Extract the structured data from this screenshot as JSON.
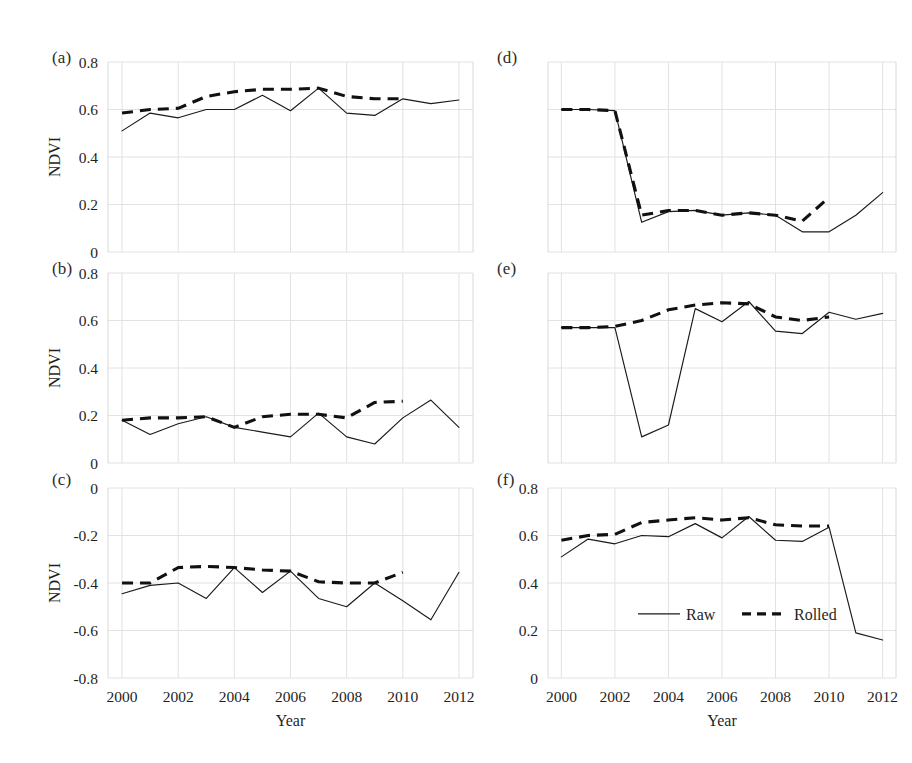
{
  "figure": {
    "background": "#ffffff",
    "grid_color": "#e2e2e2",
    "line_color": "#1a1a1a",
    "xlabel": "Year",
    "ylabel": "NDVI",
    "xticks": [
      "2000",
      "2002",
      "2004",
      "2006",
      "2008",
      "2010",
      "2012"
    ],
    "legend": {
      "raw_label": "Raw",
      "rolled_label": "Rolled"
    },
    "panel_labels": {
      "a": "(a)",
      "b": "(b)",
      "c": "(c)",
      "d": "(d)",
      "e": "(e)",
      "f": "(f)"
    }
  },
  "chart_data": [
    {
      "type": "line",
      "panel": "(a)",
      "title": "",
      "xlabel": "Year",
      "ylabel": "NDVI",
      "xlim": [
        1999.5,
        2012.5
      ],
      "ylim": [
        0,
        0.8
      ],
      "yticks": [
        0,
        0.2,
        0.4,
        0.6,
        0.8
      ],
      "ytick_labels": [
        "0",
        "0.2",
        "0.4",
        "0.6",
        "0.8"
      ],
      "xticks": [
        2000,
        2002,
        2004,
        2006,
        2008,
        2010,
        2012
      ],
      "grid": true,
      "legend": [
        "Raw",
        "Rolled"
      ],
      "x": [
        2000,
        2001,
        2002,
        2003,
        2004,
        2005,
        2006,
        2007,
        2008,
        2009,
        2010,
        2011,
        2012
      ],
      "series": [
        {
          "name": "Raw",
          "style": "solid",
          "values": [
            0.51,
            0.585,
            0.565,
            0.6,
            0.6,
            0.66,
            0.595,
            0.69,
            0.585,
            0.575,
            0.645,
            0.625,
            0.64
          ]
        },
        {
          "name": "Rolled",
          "style": "dashed",
          "values": [
            0.585,
            0.6,
            0.605,
            0.655,
            0.675,
            0.685,
            0.685,
            0.69,
            0.655,
            0.645,
            0.645,
            null,
            null
          ]
        }
      ]
    },
    {
      "type": "line",
      "panel": "(b)",
      "title": "",
      "xlabel": "Year",
      "ylabel": "NDVI",
      "xlim": [
        1999.5,
        2012.5
      ],
      "ylim": [
        0,
        0.8
      ],
      "yticks": [
        0,
        0.2,
        0.4,
        0.6,
        0.8
      ],
      "ytick_labels": [
        "0",
        "0.2",
        "0.4",
        "0.6",
        "0.8"
      ],
      "xticks": [
        2000,
        2002,
        2004,
        2006,
        2008,
        2010,
        2012
      ],
      "grid": true,
      "legend": [
        "Raw",
        "Rolled"
      ],
      "x": [
        2000,
        2001,
        2002,
        2003,
        2004,
        2005,
        2006,
        2007,
        2008,
        2009,
        2010,
        2011,
        2012
      ],
      "series": [
        {
          "name": "Raw",
          "style": "solid",
          "values": [
            0.18,
            0.12,
            0.165,
            0.195,
            0.15,
            0.13,
            0.11,
            0.21,
            0.11,
            0.08,
            0.19,
            0.265,
            0.15
          ]
        },
        {
          "name": "Rolled",
          "style": "dashed",
          "values": [
            0.18,
            0.19,
            0.19,
            0.195,
            0.15,
            0.195,
            0.205,
            0.205,
            0.19,
            0.255,
            0.26,
            null,
            null
          ]
        }
      ]
    },
    {
      "type": "line",
      "panel": "(c)",
      "title": "",
      "xlabel": "Year",
      "ylabel": "NDVI",
      "xlim": [
        1999.5,
        2012.5
      ],
      "ylim": [
        -0.8,
        0
      ],
      "yticks": [
        -0.8,
        -0.6,
        -0.4,
        -0.2,
        0
      ],
      "ytick_labels": [
        "-0.8",
        "-0.6",
        "-0.4",
        "-0.2",
        "0"
      ],
      "xticks": [
        2000,
        2002,
        2004,
        2006,
        2008,
        2010,
        2012
      ],
      "grid": true,
      "legend": [
        "Raw",
        "Rolled"
      ],
      "x": [
        2000,
        2001,
        2002,
        2003,
        2004,
        2005,
        2006,
        2007,
        2008,
        2009,
        2010,
        2011,
        2012
      ],
      "series": [
        {
          "name": "Raw",
          "style": "solid",
          "values": [
            -0.445,
            -0.41,
            -0.4,
            -0.465,
            -0.335,
            -0.44,
            -0.35,
            -0.465,
            -0.5,
            -0.4,
            -0.475,
            -0.555,
            -0.355
          ]
        },
        {
          "name": "Rolled",
          "style": "dashed",
          "values": [
            -0.4,
            -0.4,
            -0.335,
            -0.33,
            -0.335,
            -0.345,
            -0.35,
            -0.395,
            -0.4,
            -0.4,
            -0.355,
            null,
            null
          ]
        }
      ]
    },
    {
      "type": "line",
      "panel": "(d)",
      "title": "",
      "xlabel": "Year",
      "ylabel": "",
      "xlim": [
        1999.5,
        2012.5
      ],
      "ylim": [
        0,
        0.8
      ],
      "yticks": [
        0,
        0.2,
        0.4,
        0.6,
        0.8
      ],
      "ytick_labels": [],
      "xticks": [
        2000,
        2002,
        2004,
        2006,
        2008,
        2010,
        2012
      ],
      "grid": true,
      "legend": [
        "Raw",
        "Rolled"
      ],
      "x": [
        2000,
        2001,
        2002,
        2003,
        2004,
        2005,
        2006,
        2007,
        2008,
        2009,
        2010,
        2011,
        2012
      ],
      "series": [
        {
          "name": "Raw",
          "style": "solid",
          "values": [
            0.6,
            0.6,
            0.595,
            0.125,
            0.17,
            0.175,
            0.155,
            0.165,
            0.155,
            0.085,
            0.085,
            0.155,
            0.25
          ]
        },
        {
          "name": "Rolled",
          "style": "dashed",
          "values": [
            0.6,
            0.6,
            0.595,
            0.155,
            0.175,
            0.175,
            0.155,
            0.165,
            0.155,
            0.13,
            0.23,
            null,
            null
          ]
        }
      ]
    },
    {
      "type": "line",
      "panel": "(e)",
      "title": "",
      "xlabel": "Year",
      "ylabel": "",
      "xlim": [
        1999.5,
        2012.5
      ],
      "ylim": [
        0,
        0.8
      ],
      "yticks": [
        0,
        0.2,
        0.4,
        0.6,
        0.8
      ],
      "ytick_labels": [],
      "xticks": [
        2000,
        2002,
        2004,
        2006,
        2008,
        2010,
        2012
      ],
      "grid": true,
      "legend": [
        "Raw",
        "Rolled"
      ],
      "x": [
        2000,
        2001,
        2002,
        2003,
        2004,
        2005,
        2006,
        2007,
        2008,
        2009,
        2010,
        2011,
        2012
      ],
      "series": [
        {
          "name": "Raw",
          "style": "solid",
          "values": [
            0.57,
            0.57,
            0.57,
            0.11,
            0.16,
            0.65,
            0.595,
            0.68,
            0.555,
            0.545,
            0.635,
            0.605,
            0.63
          ]
        },
        {
          "name": "Rolled",
          "style": "dashed",
          "values": [
            0.57,
            0.57,
            0.575,
            0.6,
            0.645,
            0.665,
            0.675,
            0.67,
            0.615,
            0.6,
            0.615,
            null,
            null
          ]
        }
      ]
    },
    {
      "type": "line",
      "panel": "(f)",
      "title": "",
      "xlabel": "Year",
      "ylabel": "",
      "xlim": [
        1999.5,
        2012.5
      ],
      "ylim": [
        0,
        0.8
      ],
      "yticks": [
        0,
        0.2,
        0.4,
        0.6,
        0.8
      ],
      "ytick_labels": [
        "0",
        "0.2",
        "0.4",
        "0.6",
        "0.8"
      ],
      "xticks": [
        2000,
        2002,
        2004,
        2006,
        2008,
        2010,
        2012
      ],
      "grid": true,
      "legend": [
        "Raw",
        "Rolled"
      ],
      "x": [
        2000,
        2001,
        2002,
        2003,
        2004,
        2005,
        2006,
        2007,
        2008,
        2009,
        2010,
        2011,
        2012
      ],
      "series": [
        {
          "name": "Raw",
          "style": "solid",
          "values": [
            0.51,
            0.585,
            0.565,
            0.6,
            0.595,
            0.65,
            0.59,
            0.68,
            0.58,
            0.575,
            0.635,
            0.19,
            0.16
          ]
        },
        {
          "name": "Rolled",
          "style": "dashed",
          "values": [
            0.58,
            0.6,
            0.605,
            0.655,
            0.665,
            0.675,
            0.665,
            0.675,
            0.645,
            0.64,
            0.64,
            null,
            null
          ]
        }
      ]
    }
  ]
}
